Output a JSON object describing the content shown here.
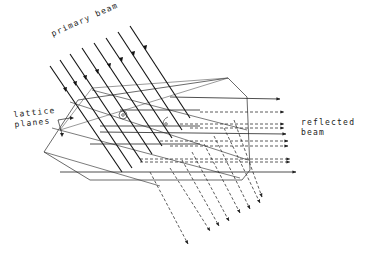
{
  "labels": {
    "primary_beam": "primary beam",
    "lattice_line1": "lattice",
    "lattice_line2": "planes",
    "reflected_line1": "reflected",
    "reflected_line2": "beam",
    "theta": "θ"
  },
  "colors": {
    "ink": "#222222",
    "background": "#ffffff"
  },
  "primary_beams": [
    [
      50,
      63,
      112,
      170
    ],
    [
      60,
      58,
      122,
      165
    ],
    [
      70,
      53,
      132,
      160
    ],
    [
      82,
      48,
      144,
      152
    ],
    [
      94,
      43,
      156,
      146
    ],
    [
      106,
      38,
      168,
      140
    ],
    [
      118,
      32,
      180,
      130
    ],
    [
      130,
      27,
      192,
      118
    ]
  ],
  "reflected_solid": [
    [
      100,
      118,
      276,
      118
    ],
    [
      80,
      158,
      286,
      158
    ],
    [
      130,
      87,
      255,
      97
    ]
  ],
  "reflected_dashed_h": [
    [
      200,
      112,
      280,
      112
    ],
    [
      180,
      126,
      283,
      126
    ],
    [
      190,
      128,
      283,
      128
    ],
    [
      150,
      140,
      285,
      140
    ],
    [
      165,
      146,
      285,
      146
    ],
    [
      120,
      150,
      286,
      150
    ]
  ],
  "diffracted_dashed": [
    [
      150,
      172,
      185,
      240
    ],
    [
      165,
      168,
      205,
      228
    ],
    [
      180,
      160,
      215,
      222
    ],
    [
      195,
      150,
      225,
      220
    ],
    [
      205,
      142,
      237,
      210
    ],
    [
      215,
      132,
      248,
      205
    ],
    [
      225,
      125,
      258,
      200
    ],
    [
      235,
      118,
      262,
      195
    ]
  ],
  "outer_polygon": [
    [
      78,
      100
    ],
    [
      228,
      78
    ],
    [
      247,
      97
    ],
    [
      250,
      170
    ],
    [
      242,
      180
    ],
    [
      90,
      180
    ],
    [
      44,
      152
    ]
  ],
  "lattice_planes": [
    [
      [
        80,
        108
      ],
      [
        240,
        160
      ]
    ],
    [
      [
        60,
        130
      ],
      [
        245,
        172
      ]
    ],
    [
      [
        100,
        92
      ],
      [
        248,
        120
      ]
    ]
  ]
}
